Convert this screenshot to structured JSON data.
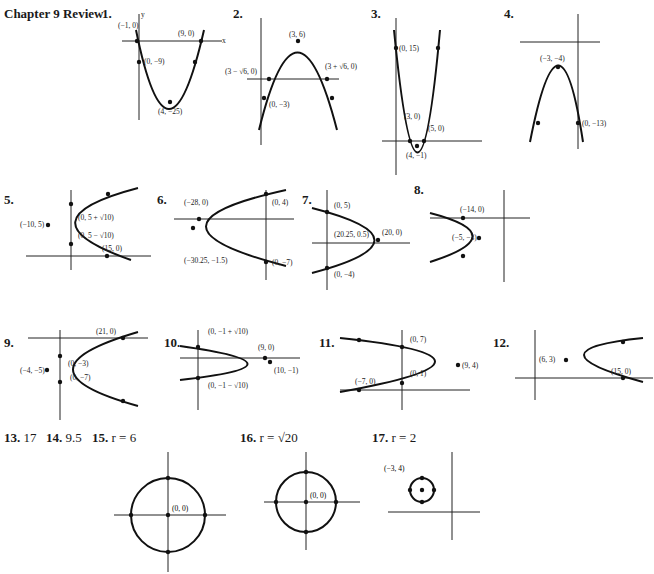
{
  "title": "Chapter 9 Review",
  "problems": [
    {
      "num": "1.",
      "labels": [
        "(−1, 0)",
        "(9, 0)",
        "(0, −9)",
        "(4, −25)"
      ],
      "xticks": [
        "−2",
        "2",
        "4",
        "6",
        "8",
        "10"
      ],
      "yticks": [
        "5",
        "−10",
        "−15",
        "−20",
        "−25",
        "−30"
      ]
    },
    {
      "num": "2.",
      "labels": [
        "(3, 6)",
        "(3 − √6, 0)",
        "(3 + √6, 0)",
        "(0, −3)"
      ],
      "xticks": [
        "−2",
        "2",
        "4",
        "6",
        "8"
      ],
      "yticks": [
        "8",
        "6",
        "4",
        "2",
        "−2",
        "−4"
      ]
    },
    {
      "num": "3.",
      "labels": [
        "(0, 15)",
        "(3, 0)",
        "(5, 0)",
        "(4, −1)"
      ],
      "xticks": [
        "−2",
        "2",
        "4",
        "6",
        "8",
        "10"
      ],
      "yticks": [
        "18",
        "16",
        "14",
        "12",
        "10",
        "8",
        "6",
        "4",
        "2",
        "−2"
      ]
    },
    {
      "num": "4.",
      "labels": [
        "(−3, −4)",
        "(0, −13)"
      ],
      "xticks": [
        "−8",
        "−6",
        "−4",
        "−2",
        "2"
      ],
      "yticks": [
        "2",
        "−4",
        "−6",
        "−8",
        "−10",
        "−12",
        "−14",
        "−16"
      ]
    },
    {
      "num": "5.",
      "labels": [
        "(−10, 5)",
        "(0, 5 + √10)",
        "(0, 5 − √10)",
        "(15, 0)"
      ],
      "xticks": [
        "−15",
        "−10",
        "−5",
        "5",
        "10",
        "15",
        "20",
        "25"
      ],
      "yticks": [
        "12",
        "10",
        "6",
        "4",
        "−2"
      ]
    },
    {
      "num": "6.",
      "labels": [
        "(−28, 0)",
        "(0, 4)",
        "(0, −7)",
        "(−30.25, −1.5)"
      ],
      "xticks": [
        "−35",
        "−30",
        "−25",
        "−20",
        "−15",
        "−10",
        "−5",
        "5"
      ],
      "yticks": [
        "6",
        "2",
        "−2",
        "−4",
        "−6",
        "−8"
      ]
    },
    {
      "num": "7.",
      "labels": [
        "(0, 5)",
        "(20.25, 0.5)",
        "(20, 0)",
        "(0, −4)"
      ],
      "xticks": [
        "−5",
        "5",
        "10",
        "15",
        "20",
        "25"
      ],
      "yticks": [
        "6",
        "4",
        "2",
        "−2",
        "−6"
      ]
    },
    {
      "num": "8.",
      "labels": [
        "(−14, 0)",
        "(−5, −3)"
      ],
      "xticks": [
        "−20",
        "−16",
        "−12",
        "−8",
        "−4",
        "4"
      ],
      "yticks": [
        "2",
        "−2",
        "−4",
        "−6",
        "−8"
      ]
    },
    {
      "num": "9.",
      "labels": [
        "(21, 0)",
        "(0, −3)",
        "(−4, −5)",
        "(0, −7)"
      ],
      "xticks": [
        "−8",
        "−4",
        "4",
        "8",
        "12",
        "16",
        "20",
        "24"
      ],
      "yticks": [
        "2",
        "−2",
        "−10",
        "−12"
      ]
    },
    {
      "num": "10.",
      "labels": [
        "(0, −1 + √10)",
        "(9, 0)",
        "(10, −1)",
        "(0, −1 − √10)"
      ],
      "xticks": [
        "−4",
        "−2",
        "2",
        "4",
        "6",
        "8",
        "12"
      ],
      "yticks": [
        "4",
        "2",
        "−2",
        "−6"
      ]
    },
    {
      "num": "11.",
      "labels": [
        "(0, 7)",
        "(9, 4)",
        "(0, 1)",
        "(−7, 0)"
      ],
      "xticks": [
        "−10",
        "−8",
        "−6",
        "−4",
        "−2",
        "2",
        "4",
        "6",
        "8",
        "10"
      ],
      "yticks": [
        "10",
        "8",
        "6",
        "4",
        "2",
        "−2"
      ]
    },
    {
      "num": "12.",
      "labels": [
        "(6, 3)",
        "(15, 0)"
      ],
      "xticks": [
        "−2",
        "2",
        "4",
        "6",
        "8",
        "10",
        "12",
        "14",
        "16",
        "18"
      ],
      "yticks": [
        "6",
        "4",
        "2",
        "−2"
      ]
    }
  ],
  "answers": [
    {
      "num": "13.",
      "value": "17"
    },
    {
      "num": "14.",
      "value": "9.5"
    },
    {
      "num": "15.",
      "value": "r = 6"
    },
    {
      "num": "16.",
      "value": "r = √20"
    },
    {
      "num": "17.",
      "value": "r = 2"
    }
  ],
  "circles": [
    {
      "num": "15",
      "label": "(0, 0)",
      "xticks": [
        "−8",
        "−6",
        "−4",
        "−2",
        "2",
        "4",
        "6",
        "8"
      ],
      "yticks": [
        "8",
        "6",
        "4",
        "2",
        "−2",
        "−4",
        "−6",
        "−8"
      ]
    },
    {
      "num": "16",
      "label": "(0, 0)",
      "xticks": [
        "−6",
        "−4",
        "−2",
        "2",
        "4",
        "6"
      ],
      "yticks": [
        "6",
        "4",
        "2",
        "−2",
        "−4",
        "−6"
      ]
    },
    {
      "num": "17",
      "label": "(−3, 4)",
      "xticks": [
        "−6",
        "−4",
        "−2",
        "2"
      ],
      "yticks": [
        "8",
        "6",
        "4",
        "2",
        "−2"
      ]
    }
  ],
  "axis_labels": {
    "x": "x",
    "y": "y"
  }
}
